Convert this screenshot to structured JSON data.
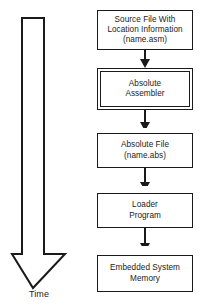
{
  "diagram": {
    "timeline": {
      "label": "Time",
      "direction": "downward",
      "arrow_icon": "down-arrow-outline-icon"
    },
    "colors": {
      "stroke": "#1a1a1a",
      "fill": "#ffffff",
      "text": "#1a1a1a"
    },
    "nodes": [
      {
        "id": "source-file",
        "label": "Source File With\nLocation Information\n(name.asm)",
        "shape": "rectangle",
        "style": "single-border"
      },
      {
        "id": "absolute-assembler",
        "label": "Absolute\nAssembler",
        "shape": "rectangle",
        "style": "double-border"
      },
      {
        "id": "absolute-file",
        "label": "Absolute File\n(name.abs)",
        "shape": "rectangle",
        "style": "single-border"
      },
      {
        "id": "loader-program",
        "label": "Loader\nProgram",
        "shape": "rectangle",
        "style": "single-border"
      },
      {
        "id": "embedded-system-memory",
        "label": "Embedded System\nMemory",
        "shape": "rectangle",
        "style": "single-border"
      }
    ],
    "connectors": [
      {
        "from": "source-file",
        "to": "absolute-assembler",
        "icon": "down-arrow-icon"
      },
      {
        "from": "absolute-assembler",
        "to": "absolute-file",
        "icon": "down-arrow-icon"
      },
      {
        "from": "absolute-file",
        "to": "loader-program",
        "icon": "down-arrow-icon"
      },
      {
        "from": "loader-program",
        "to": "embedded-system-memory",
        "icon": "down-arrow-icon"
      }
    ]
  }
}
